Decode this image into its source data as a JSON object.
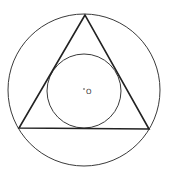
{
  "diagram": {
    "title": "",
    "center_label": "O",
    "colors": {
      "stroke": "#3a3a3a",
      "triangle_stroke": "#222222",
      "background": "#ffffff"
    },
    "outer_circle": {
      "cx": 84,
      "cy": 90,
      "r": 76
    },
    "inner_circle": {
      "cx": 84,
      "cy": 91,
      "r": 37
    },
    "triangle": {
      "vertices": [
        [
          85,
          15
        ],
        [
          19,
          128
        ],
        [
          149,
          129
        ]
      ]
    },
    "center_point": {
      "x": 84,
      "y": 89
    }
  }
}
